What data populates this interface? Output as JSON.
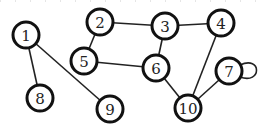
{
  "graph": {
    "nodes": [
      {
        "id": "1",
        "label": "1",
        "x": 26,
        "y": 35
      },
      {
        "id": "2",
        "label": "2",
        "x": 100,
        "y": 22
      },
      {
        "id": "3",
        "label": "3",
        "x": 165,
        "y": 26
      },
      {
        "id": "4",
        "label": "4",
        "x": 221,
        "y": 23
      },
      {
        "id": "5",
        "label": "5",
        "x": 84,
        "y": 61
      },
      {
        "id": "6",
        "label": "6",
        "x": 156,
        "y": 68
      },
      {
        "id": "7",
        "label": "7",
        "x": 229,
        "y": 71
      },
      {
        "id": "8",
        "label": "8",
        "x": 40,
        "y": 98
      },
      {
        "id": "9",
        "label": "9",
        "x": 110,
        "y": 109
      },
      {
        "id": "10",
        "label": "10",
        "x": 188,
        "y": 108
      }
    ],
    "edges": [
      [
        "1",
        "8"
      ],
      [
        "1",
        "9"
      ],
      [
        "2",
        "3"
      ],
      [
        "2",
        "5"
      ],
      [
        "3",
        "4"
      ],
      [
        "3",
        "6"
      ],
      [
        "5",
        "6"
      ],
      [
        "6",
        "10"
      ],
      [
        "4",
        "10"
      ],
      [
        "7",
        "10"
      ],
      [
        "7",
        "7"
      ]
    ]
  }
}
